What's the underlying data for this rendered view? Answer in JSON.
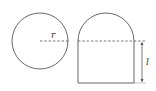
{
  "figure": {
    "left_shape": {
      "name": "circle",
      "radius_label": "r"
    },
    "right_shape": {
      "name": "semicircle-topped-rectangle",
      "height_label": "l"
    },
    "colors": {
      "stroke": "#555555",
      "background": "#ffffff"
    }
  }
}
